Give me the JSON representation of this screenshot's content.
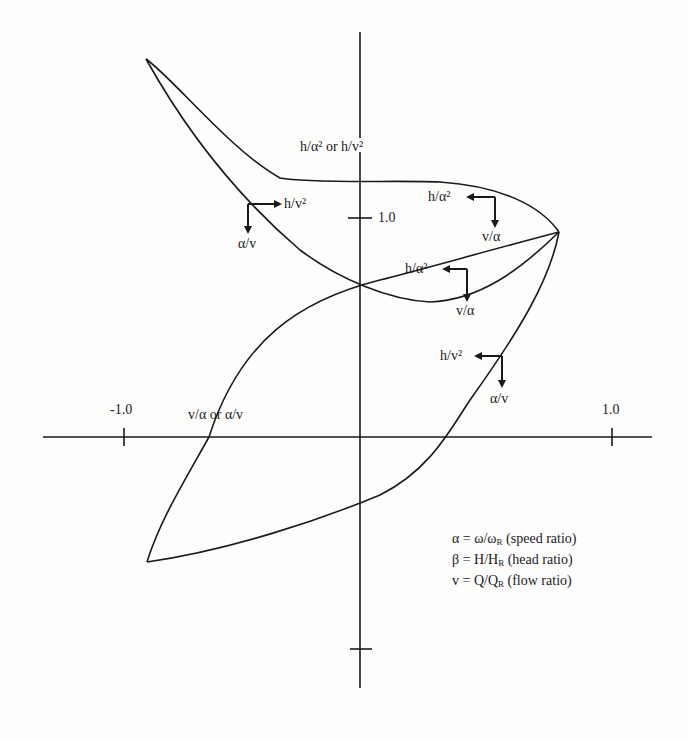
{
  "diagram": {
    "title": "",
    "axes": {
      "y_label": "h/α² or h/v²",
      "x_label": "v/α or α/v",
      "y_tick": "1.0",
      "x_tick_neg": "-1.0",
      "x_tick_pos": "1.0"
    },
    "annotations": [
      {
        "h": "h/v²",
        "v": "α/v",
        "position": "upper-left"
      },
      {
        "h": "h/α²",
        "v": "v/α",
        "position": "upper-right"
      },
      {
        "h": "h/α²",
        "v": "v/α",
        "position": "center"
      },
      {
        "h": "h/v²",
        "v": "α/v",
        "position": "lower-right"
      }
    ],
    "legend": [
      {
        "sym": "α",
        "eq": "ω/ω",
        "sub": "R",
        "desc": "(speed ratio)"
      },
      {
        "sym": "β",
        "eq": "H/H",
        "sub": "R",
        "desc": "(head ratio)"
      },
      {
        "sym": "v",
        "eq": "Q/Q",
        "sub": "R",
        "desc": "(flow ratio)"
      }
    ],
    "colors": {
      "line": "#1a1a1a",
      "background": "#fdfdfc"
    }
  }
}
